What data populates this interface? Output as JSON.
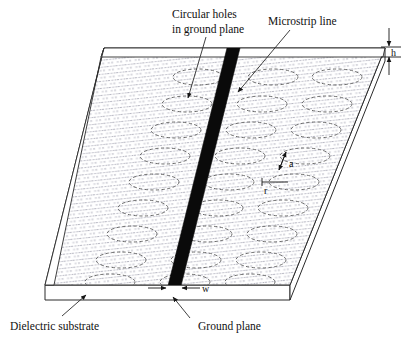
{
  "figure": {
    "background_color": "#ffffff",
    "line_color": "#2a2a2a",
    "hole_stroke_color": "#6d6d6d",
    "microstrip_color": "#0a0a0a",
    "stipple_color": "#b9b9c4"
  },
  "labels": {
    "circular_holes_line1": "Circular holes",
    "circular_holes_line2": "in ground plane",
    "microstrip_line": "Microstrip line",
    "dielectric_substrate": "Dielectric substrate",
    "ground_plane": "Ground plane"
  },
  "dimensions": {
    "h": "h",
    "a": "a",
    "r": "r",
    "w": "w"
  },
  "hole_grid": {
    "columns": 3,
    "rows": 9,
    "note": "dashed ellipses arranged in a skewed grid across the ground plane"
  },
  "geometry": {
    "slab_top_face": "parallelogram",
    "slab_thickness_edge": "front band",
    "perspective": "oblique, rows shift left toward the viewer"
  }
}
